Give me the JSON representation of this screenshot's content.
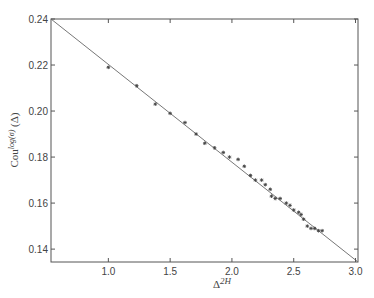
{
  "chart_data": {
    "type": "scatter",
    "title": "",
    "xlabel": "Δ^{2H}",
    "ylabel": "Cou^{log(σ)} (Δ)",
    "xlim": [
      0.536,
      3.02
    ],
    "ylim": [
      0.1344,
      0.24
    ],
    "xticks": [
      1.0,
      1.5,
      2.0,
      2.5,
      3.0
    ],
    "xtick_labels": [
      "1.0",
      "1.5",
      "2.0",
      "2.5",
      "3.0"
    ],
    "yticks": [
      0.14,
      0.16,
      0.18,
      0.2,
      0.22,
      0.24
    ],
    "ytick_labels": [
      "0.14",
      "0.16",
      "0.18",
      "0.20",
      "0.22",
      "0.24"
    ],
    "grid": false,
    "legend": null,
    "series": [
      {
        "name": "data",
        "kind": "points",
        "marker": "star",
        "x": [
          1.0,
          1.23,
          1.38,
          1.5,
          1.62,
          1.71,
          1.78,
          1.86,
          1.93,
          1.98,
          2.05,
          2.1,
          2.15,
          2.19,
          2.24,
          2.27,
          2.31,
          2.32,
          2.35,
          2.39,
          2.44,
          2.47,
          2.5,
          2.54,
          2.56,
          2.58,
          2.61,
          2.64,
          2.67,
          2.7,
          2.73
        ],
        "y": [
          0.219,
          0.211,
          0.203,
          0.199,
          0.195,
          0.19,
          0.186,
          0.184,
          0.182,
          0.18,
          0.179,
          0.176,
          0.172,
          0.17,
          0.17,
          0.168,
          0.166,
          0.163,
          0.162,
          0.162,
          0.16,
          0.159,
          0.157,
          0.156,
          0.155,
          0.153,
          0.15,
          0.149,
          0.149,
          0.148,
          0.148
        ]
      },
      {
        "name": "fit",
        "kind": "line",
        "x": [
          0.536,
          3.02
        ],
        "y": [
          0.24,
          0.1344
        ]
      }
    ],
    "colors": {
      "axes": "#555555",
      "line": "#777777",
      "points": "#444444",
      "text": "#444444"
    }
  }
}
